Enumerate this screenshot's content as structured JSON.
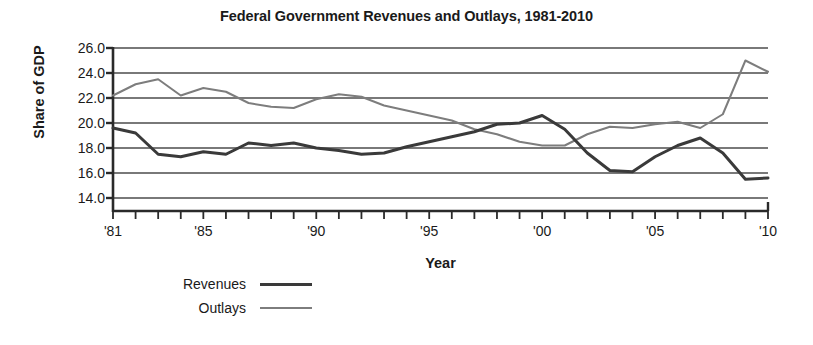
{
  "chart_data": {
    "type": "line",
    "title": "Federal Government Revenues and Outlays, 1981-2010",
    "xlabel": "Year",
    "ylabel": "Share of GDP",
    "ylim": [
      13.0,
      26.6
    ],
    "xlim": [
      1981,
      2010
    ],
    "grid": true,
    "legend_position": "below-left",
    "y_ticks": [
      "26.0",
      "24.0",
      "22.0",
      "20.0",
      "18.0",
      "16.0",
      "14.0"
    ],
    "y_tick_values": [
      26.0,
      24.0,
      22.0,
      20.0,
      18.0,
      16.0,
      14.0
    ],
    "x_tick_labels": [
      "'81",
      "'85",
      "'90",
      "'95",
      "'00",
      "'05",
      "'10"
    ],
    "x_tick_values": [
      1981,
      1985,
      1990,
      1995,
      2000,
      2005,
      2010
    ],
    "x": [
      1981,
      1982,
      1983,
      1984,
      1985,
      1986,
      1987,
      1988,
      1989,
      1990,
      1991,
      1992,
      1993,
      1994,
      1995,
      1996,
      1997,
      1998,
      1999,
      2000,
      2001,
      2002,
      2003,
      2004,
      2005,
      2006,
      2007,
      2008,
      2009,
      2010
    ],
    "series": [
      {
        "name": "Revenues",
        "color": "#3a3a3a",
        "width": 3,
        "values": [
          19.6,
          19.2,
          17.5,
          17.3,
          17.7,
          17.5,
          18.4,
          18.2,
          18.4,
          18.0,
          17.8,
          17.5,
          17.6,
          18.1,
          18.5,
          18.9,
          19.3,
          19.9,
          20.0,
          20.6,
          19.5,
          17.6,
          16.2,
          16.1,
          17.3,
          18.2,
          18.8,
          17.6,
          15.5,
          15.6
        ]
      },
      {
        "name": "Outlays",
        "color": "#7d7d7d",
        "width": 2,
        "values": [
          22.2,
          23.1,
          23.5,
          22.2,
          22.8,
          22.5,
          21.6,
          21.3,
          21.2,
          21.9,
          22.3,
          22.1,
          21.4,
          21.0,
          20.6,
          20.2,
          19.5,
          19.1,
          18.5,
          18.2,
          18.2,
          19.1,
          19.7,
          19.6,
          19.9,
          20.1,
          19.6,
          20.7,
          25.0,
          24.1
        ]
      }
    ]
  },
  "legend": {
    "items": [
      {
        "label": "Revenues"
      },
      {
        "label": "Outlays"
      }
    ]
  },
  "axes": {
    "y_title": "Share of GDP",
    "x_title": "Year"
  }
}
